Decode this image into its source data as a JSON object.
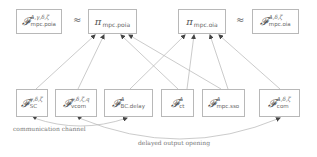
{
  "diagram": {
    "top_row": [
      {
        "id": "F_mpc_poia",
        "symbol": "𝓕",
        "sup": "Δ,γ,δ,ζ",
        "sub": "mpc.poia"
      },
      {
        "id": "pi_mpc_poia",
        "symbol": "π",
        "sub": "mpc.poia"
      },
      {
        "id": "pi_mpc_oia",
        "symbol": "π",
        "sub": "mpc.oia"
      },
      {
        "id": "F_mpc_oia",
        "symbol": "𝓕",
        "sup": "Δ,δ,ζ",
        "sub": "mpc.oia"
      }
    ],
    "approx_symbols": [
      "≈",
      "≈"
    ],
    "bottom_row": [
      {
        "id": "F_SC",
        "symbol": "𝓕",
        "sup": "γ,δ,ζ",
        "sub": "SC"
      },
      {
        "id": "F_vcom",
        "symbol": "𝓕",
        "sup": "γ,δ,ζ,q",
        "sub": "vcom"
      },
      {
        "id": "F_BC_delay",
        "symbol": "𝓕",
        "sup": "Δ",
        "sub": "BC.delay"
      },
      {
        "id": "F_ct",
        "symbol": "𝓕",
        "sup": "Δ",
        "sub": "ct"
      },
      {
        "id": "F_mpc_sso",
        "symbol": "𝓕",
        "sup": "Δ",
        "sub": "mpc.sso"
      },
      {
        "id": "F_com",
        "symbol": "𝓕",
        "sup": "Δ,δ,ζ",
        "sub": "com"
      }
    ],
    "edges": [
      {
        "from": "F_SC",
        "to": "pi_mpc_poia"
      },
      {
        "from": "F_vcom",
        "to": "pi_mpc_poia"
      },
      {
        "from": "F_ct",
        "to": "pi_mpc_poia"
      },
      {
        "from": "F_mpc_sso",
        "to": "pi_mpc_poia"
      },
      {
        "from": "F_BC_delay",
        "to": "pi_mpc_oia"
      },
      {
        "from": "F_ct",
        "to": "pi_mpc_oia"
      },
      {
        "from": "F_mpc_sso",
        "to": "pi_mpc_oia"
      },
      {
        "from": "F_com",
        "to": "pi_mpc_oia"
      }
    ],
    "curved_edges": [
      {
        "from": "F_SC",
        "to": "F_BC_delay",
        "label": "communication channel"
      },
      {
        "from": "F_vcom",
        "to": "F_com",
        "label": "delayed output opening"
      }
    ],
    "labels": {
      "communication_channel": "communication channel",
      "delayed_output_opening": "delayed output opening"
    },
    "colors": {
      "line": "#b0b0b0",
      "box_border": "#b8b8b8",
      "text": "#555555"
    }
  }
}
